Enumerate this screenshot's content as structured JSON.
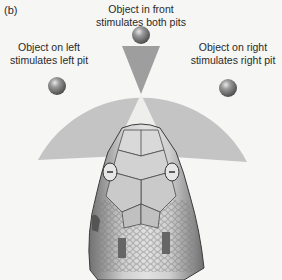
{
  "figure": {
    "panel_label": "(b)",
    "labels": {
      "front": [
        "Object in front",
        "stimulates both pits"
      ],
      "left": [
        "Object on left",
        "stimulates left pit"
      ],
      "right": [
        "Object on right",
        "stimulates right pit"
      ]
    },
    "colors": {
      "background": "#f6f6f4",
      "field_of_view": "#c4c4c4",
      "overlap_wedge": "#9e9e9e",
      "sphere": "#7a7a7a",
      "snake_head": "#b8b8b8",
      "text": "#2a2a2a"
    },
    "objects": [
      {
        "name": "front",
        "x": 141,
        "y": 35
      },
      {
        "name": "left",
        "x": 57,
        "y": 86
      },
      {
        "name": "right",
        "x": 228,
        "y": 88
      }
    ]
  }
}
